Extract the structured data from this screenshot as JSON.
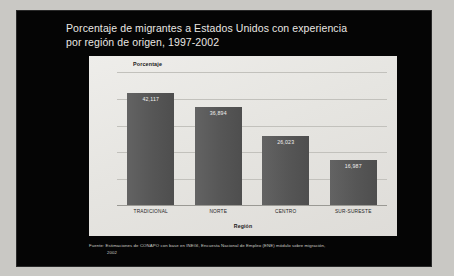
{
  "slide": {
    "title": "Porcentaje de migrantes a Estados Unidos con experiencia\npor región de origen, 1997-2002",
    "source_note_line1": "Fuente: Estimaciones de CONAPO con base en INEGI, Encuesta Nacional de Empleo (ENE) módulo sobre migración,",
    "source_note_line2": "2002",
    "background_color": "#050505",
    "title_color": "#e9e7e3",
    "panel_color": "#e8e7e3"
  },
  "chart_data": {
    "type": "bar",
    "title": "",
    "categories": [
      "TRADICIONAL",
      "NORTE",
      "CENTRO",
      "SUR-SURESTE"
    ],
    "values": [
      42117,
      36894,
      26023,
      16987
    ],
    "value_labels": [
      "42,117",
      "36,894",
      "26,023",
      "16,987"
    ],
    "xlabel": "Región",
    "ylabel": "Porcentaje",
    "ylim": [
      0,
      50000
    ],
    "grid": true,
    "gridline_count": 5,
    "legend": "none",
    "bar_color": "#5b5b5b",
    "value_label_color": "#f2f1ef"
  }
}
